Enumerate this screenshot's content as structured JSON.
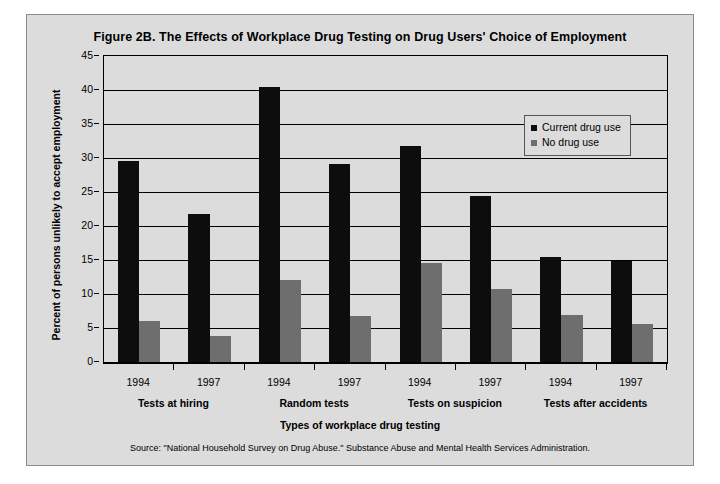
{
  "figure": {
    "title": "Figure 2B. The Effects of Workplace Drug Testing on Drug Users' Choice of Employment",
    "source": "Source: \"National Household Survey on Drug Abuse.\"  Substance Abuse and Mental Health Services Administration."
  },
  "legend": {
    "items": [
      {
        "label": "Current drug use",
        "color": "#0d0d0d",
        "icon": "square-marker-icon"
      },
      {
        "label": "No drug use",
        "color": "#6e6e6e",
        "icon": "square-marker-icon"
      }
    ]
  },
  "chart_data": {
    "type": "bar",
    "title": "Figure 2B. The Effects of Workplace Drug Testing on Drug Users' Choice of Employment",
    "xlabel": "Types of workplace drug testing",
    "ylabel": "Percent of persons unlikely to accept employment",
    "ylim": [
      0,
      45
    ],
    "ytick_step": 5,
    "yticks": [
      0,
      5,
      10,
      15,
      20,
      25,
      30,
      35,
      40,
      45
    ],
    "ytick_labels": [
      "0",
      "5",
      "10",
      "15",
      "20",
      "25",
      "30",
      "35",
      "40",
      "45"
    ],
    "grid": true,
    "legend_position": "inside-upper-right",
    "groups": [
      {
        "label": "Tests at hiring",
        "years": [
          "1994",
          "1997"
        ]
      },
      {
        "label": "Random tests",
        "years": [
          "1994",
          "1997"
        ]
      },
      {
        "label": "Tests on suspicion",
        "years": [
          "1994",
          "1997"
        ]
      },
      {
        "label": "Tests after accidents",
        "years": [
          "1994",
          "1997"
        ]
      }
    ],
    "categories": [
      "Tests at hiring 1994",
      "Tests at hiring 1997",
      "Random tests 1994",
      "Random tests 1997",
      "Tests on suspicion 1994",
      "Tests on suspicion 1997",
      "Tests after accidents 1994",
      "Tests after accidents 1997"
    ],
    "series": [
      {
        "name": "Current drug use",
        "color": "#0d0d0d",
        "values": [
          29.5,
          21.8,
          40.5,
          29.1,
          31.7,
          24.4,
          15.4,
          14.8
        ]
      },
      {
        "name": "No drug use",
        "color": "#6e6e6e",
        "values": [
          6.0,
          3.8,
          12.0,
          6.8,
          14.5,
          10.8,
          6.9,
          5.6
        ]
      }
    ]
  }
}
